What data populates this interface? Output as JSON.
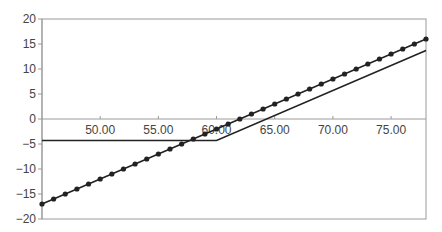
{
  "chart_data": {
    "type": "line",
    "title": "",
    "xlabel": "",
    "ylabel": "",
    "xlim": [
      45,
      78
    ],
    "ylim": [
      -20,
      20
    ],
    "grid": false,
    "legend": null,
    "y_ticks": [
      20,
      15,
      10,
      5,
      0,
      -5,
      -10,
      -15,
      -20
    ],
    "y_tick_labels": [
      "20",
      "15",
      "10",
      "5",
      "0",
      "-5",
      "-10",
      "-15",
      "-20"
    ],
    "x_ticks": [
      50,
      55,
      60,
      65,
      70,
      75
    ],
    "x_tick_labels": [
      "50.00",
      "55.00",
      "60.00",
      "65.00",
      "70.00",
      "75.00"
    ],
    "x_axis_position": 0,
    "series": [
      {
        "name": "Line with markers",
        "style": "line-markers",
        "color": "#222222",
        "x": [
          45,
          46,
          47,
          48,
          49,
          50,
          51,
          52,
          53,
          54,
          55,
          56,
          57,
          58,
          59,
          60,
          61,
          62,
          63,
          64,
          65,
          66,
          67,
          68,
          69,
          70,
          71,
          72,
          73,
          74,
          75,
          76,
          77,
          78
        ],
        "y": [
          -17,
          -16,
          -15,
          -14,
          -13,
          -12,
          -11,
          -10,
          -9,
          -8,
          -7,
          -6,
          -5,
          -4,
          -3,
          -2,
          -1,
          0,
          1,
          2,
          3,
          4,
          5,
          6,
          7,
          8,
          9,
          10,
          11,
          12,
          13,
          14,
          15,
          16
        ]
      },
      {
        "name": "Plain line",
        "style": "line",
        "color": "#222222",
        "x": [
          45,
          60,
          78
        ],
        "y": [
          -4.3,
          -4.3,
          13.7
        ]
      }
    ]
  }
}
